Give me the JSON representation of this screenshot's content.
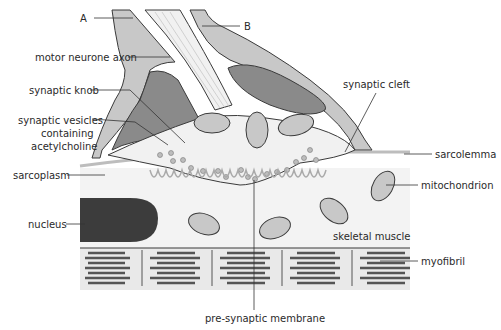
{
  "diagram": {
    "labels": {
      "A": "A",
      "B": "B",
      "motor_neurone_axon": "motor neurone axon",
      "synaptic_knob": "synaptic knob",
      "synaptic_vesicles_1": "synaptic vesicles",
      "synaptic_vesicles_2": "containing",
      "synaptic_vesicles_3": "acetylcholine",
      "synaptic_cleft": "synaptic cleft",
      "sarcolemma": "sarcolemma",
      "sarcoplasm": "sarcoplasm",
      "mitochondrion": "mitochondrion",
      "nucleus": "nucleus",
      "skeletal_muscle": "skeletal muscle",
      "myofibril": "myofibril",
      "pre_synaptic_membrane": "pre-synaptic membrane"
    },
    "colors": {
      "outline": "#3a3a3a",
      "sheath_fill": "#c8c8c8",
      "dark_fill": "#8a8a8a",
      "nucleus_fill": "#3c3c3c",
      "cytoplasm_fill": "#f1f1f1",
      "muscle_fill": "#f3f3f3",
      "myofibril_fill": "#e9e9e9",
      "vesicle_fill": "#bdbdbd"
    }
  }
}
